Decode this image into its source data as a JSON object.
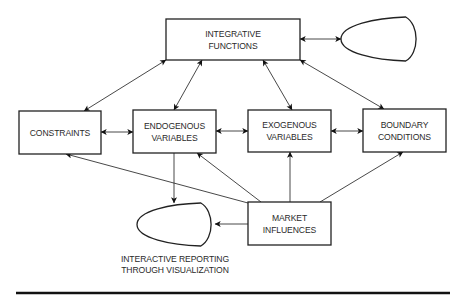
{
  "diagram": {
    "nodes": [
      {
        "id": "integrative",
        "shape": "box",
        "lines": [
          "INTEGRATIVE",
          "FUNCTIONS"
        ]
      },
      {
        "id": "constraints",
        "shape": "box",
        "lines": [
          "CONSTRAINTS"
        ]
      },
      {
        "id": "endogenous",
        "shape": "box",
        "lines": [
          "ENDOGENOUS",
          "VARIABLES"
        ]
      },
      {
        "id": "exogenous",
        "shape": "box",
        "lines": [
          "EXOGENOUS",
          "VARIABLES"
        ]
      },
      {
        "id": "boundary",
        "shape": "box",
        "lines": [
          "BOUNDARY",
          "CONDITIONS"
        ]
      },
      {
        "id": "market",
        "shape": "box",
        "lines": [
          "MARKET",
          "INFLUENCES"
        ]
      },
      {
        "id": "integrative-output",
        "shape": "terminal",
        "lines": []
      },
      {
        "id": "reporting",
        "shape": "terminal",
        "lines": []
      }
    ],
    "captions": {
      "reporting": [
        "INTERACTIVE REPORTING",
        "THROUGH VISUALIZATION"
      ]
    },
    "edges": [
      {
        "from": "constraints",
        "to": "integrative",
        "direction": "both"
      },
      {
        "from": "endogenous",
        "to": "integrative",
        "direction": "both"
      },
      {
        "from": "exogenous",
        "to": "integrative",
        "direction": "both"
      },
      {
        "from": "boundary",
        "to": "integrative",
        "direction": "both"
      },
      {
        "from": "integrative",
        "to": "integrative-output",
        "direction": "both"
      },
      {
        "from": "constraints",
        "to": "endogenous",
        "direction": "both"
      },
      {
        "from": "endogenous",
        "to": "exogenous",
        "direction": "both"
      },
      {
        "from": "exogenous",
        "to": "boundary",
        "direction": "both"
      },
      {
        "from": "endogenous",
        "to": "reporting",
        "direction": "forward"
      },
      {
        "from": "market",
        "to": "reporting",
        "direction": "forward"
      },
      {
        "from": "market",
        "to": "constraints",
        "direction": "forward"
      },
      {
        "from": "market",
        "to": "endogenous",
        "direction": "forward"
      },
      {
        "from": "market",
        "to": "exogenous",
        "direction": "forward"
      },
      {
        "from": "market",
        "to": "boundary",
        "direction": "forward"
      }
    ]
  }
}
